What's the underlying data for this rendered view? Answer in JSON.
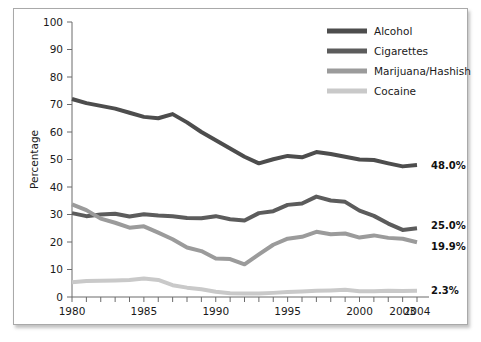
{
  "chart_data": {
    "type": "line",
    "title": "",
    "xlabel": "",
    "ylabel": "Percentage",
    "xlim": [
      1980,
      2004
    ],
    "ylim": [
      0,
      100
    ],
    "grid": false,
    "legend_position": "top-right",
    "x": [
      1980,
      1981,
      1982,
      1983,
      1984,
      1985,
      1986,
      1987,
      1988,
      1989,
      1990,
      1991,
      1992,
      1993,
      1994,
      1995,
      1996,
      1997,
      1998,
      1999,
      2000,
      2001,
      2002,
      2003,
      2004
    ],
    "x_tick_labels": [
      "1980",
      "1985",
      "1990",
      "1995",
      "2000",
      "2003",
      "2004"
    ],
    "x_tick_values": [
      1980,
      1985,
      1990,
      1995,
      2000,
      2003,
      2004
    ],
    "y_tick_labels": [
      "0",
      "10",
      "20",
      "30",
      "40",
      "50",
      "60",
      "70",
      "80",
      "90",
      "100"
    ],
    "y_tick_values": [
      0,
      10,
      20,
      30,
      40,
      50,
      60,
      70,
      80,
      90,
      100
    ],
    "series": [
      {
        "name": "Alcohol",
        "color": "#4d4d4d",
        "end_label": "48.0%",
        "values": [
          72.0,
          70.5,
          69.5,
          68.5,
          67.0,
          65.5,
          65.0,
          66.5,
          63.5,
          60.0,
          57.0,
          54.0,
          51.0,
          48.6,
          50.1,
          51.3,
          50.8,
          52.7,
          52.0,
          51.0,
          50.0,
          49.8,
          48.6,
          47.5,
          48.0
        ]
      },
      {
        "name": "Cigarettes",
        "color": "#5c5c5c",
        "end_label": "25.0%",
        "values": [
          30.5,
          29.4,
          30.0,
          30.3,
          29.3,
          30.1,
          29.6,
          29.4,
          28.7,
          28.6,
          29.4,
          28.3,
          27.8,
          30.5,
          31.2,
          33.5,
          34.0,
          36.5,
          35.1,
          34.6,
          31.4,
          29.5,
          26.7,
          24.4,
          25.0
        ]
      },
      {
        "name": "Marijuana/Hashish",
        "color": "#9b9b9b",
        "end_label": "19.9%",
        "values": [
          33.7,
          31.6,
          28.5,
          27.0,
          25.2,
          25.7,
          23.4,
          21.0,
          18.0,
          16.7,
          14.0,
          13.8,
          11.9,
          15.5,
          19.0,
          21.2,
          21.9,
          23.7,
          22.8,
          23.1,
          21.6,
          22.4,
          21.5,
          21.2,
          19.9
        ]
      },
      {
        "name": "Cocaine",
        "color": "#c9c9c9",
        "end_label": "2.3%",
        "values": [
          5.4,
          5.8,
          5.9,
          6.0,
          6.2,
          6.7,
          6.2,
          4.3,
          3.4,
          2.8,
          1.9,
          1.4,
          1.3,
          1.3,
          1.5,
          1.8,
          2.0,
          2.3,
          2.4,
          2.6,
          2.1,
          2.1,
          2.3,
          2.2,
          2.3
        ]
      }
    ]
  },
  "legend": {
    "items": [
      {
        "label": "Alcohol"
      },
      {
        "label": "Cigarettes"
      },
      {
        "label": "Marijuana/Hashish"
      },
      {
        "label": "Cocaine"
      }
    ]
  }
}
